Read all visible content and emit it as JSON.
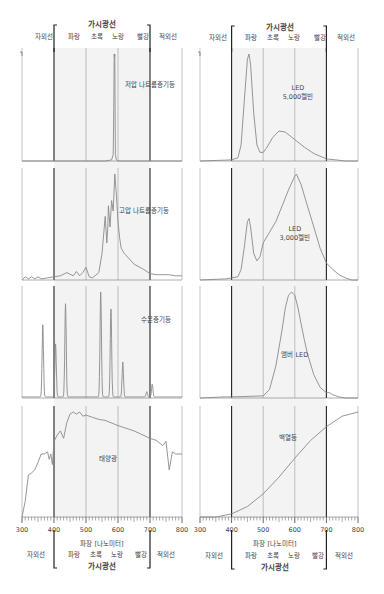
{
  "header": {
    "left": {
      "visible_label": "가시광선",
      "uv": "자외선",
      "ir": "적외선",
      "bands": [
        "파랑",
        "초록",
        "노랑",
        "빨강"
      ]
    },
    "right": {
      "visible_label": "가시광선",
      "uv": "자외선",
      "ir": "적외선",
      "bands": [
        "파랑",
        "초록",
        "노랑",
        "빨강"
      ]
    }
  },
  "footer": {
    "left": {
      "xlabel": "파장 [나노미터]",
      "visible_label": "가시광선",
      "uv": "자외선",
      "ir": "적외선",
      "bands": [
        "파랑",
        "초록",
        "노랑",
        "빨강"
      ]
    },
    "right": {
      "xlabel": "파장 [나노미터]",
      "visible_label": "가시광선",
      "uv": "자외선",
      "ir": "적외선",
      "bands": [
        "파랑",
        "초록",
        "노랑",
        "빨강"
      ]
    }
  },
  "colors": {
    "curve": "#8a8a8a",
    "boundary_line": "#222222",
    "grid_line": "#9a9a9a",
    "visible_fill": "#f3f3f3",
    "text": "#444444"
  },
  "chart_data": [
    {
      "type": "line",
      "title": "저압 나트륨증기등",
      "xlabel": "파장 [나노미터]",
      "ylabel": "",
      "xlim": [
        300,
        800
      ],
      "ylim": [
        0,
        1
      ],
      "x": [
        300,
        560,
        580,
        585,
        587,
        588,
        589,
        590,
        591,
        592,
        595,
        600,
        800
      ],
      "values": [
        0,
        0,
        0.01,
        0.06,
        0.5,
        1.0,
        0.97,
        1.0,
        0.5,
        0.06,
        0.01,
        0,
        0
      ]
    },
    {
      "type": "line",
      "title": "LED 5,000켈빈",
      "xlabel": "파장 [나노미터]",
      "ylabel": "",
      "xlim": [
        300,
        800
      ],
      "ylim": [
        0,
        1
      ],
      "x": [
        300,
        400,
        420,
        430,
        440,
        450,
        455,
        460,
        470,
        480,
        490,
        500,
        510,
        530,
        550,
        570,
        600,
        630,
        660,
        700,
        730,
        760,
        800
      ],
      "values": [
        0,
        0.01,
        0.03,
        0.15,
        0.55,
        0.95,
        1.0,
        0.9,
        0.45,
        0.15,
        0.08,
        0.08,
        0.12,
        0.22,
        0.28,
        0.27,
        0.2,
        0.13,
        0.07,
        0.02,
        0.01,
        0.0,
        0
      ]
    },
    {
      "type": "line",
      "title": "고압 나트륨증기등",
      "xlabel": "파장 [나노미터]",
      "ylabel": "",
      "xlim": [
        300,
        800
      ],
      "ylim": [
        0,
        1
      ],
      "x": [
        300,
        310,
        320,
        330,
        340,
        350,
        360,
        380,
        400,
        420,
        440,
        460,
        470,
        480,
        490,
        500,
        510,
        520,
        540,
        550,
        560,
        565,
        568,
        570,
        575,
        580,
        585,
        590,
        595,
        600,
        605,
        610,
        620,
        650,
        680,
        700,
        720,
        740,
        760,
        780,
        800
      ],
      "values": [
        0.0,
        0.03,
        0.01,
        0.03,
        0.01,
        0.03,
        0.01,
        0.02,
        0.03,
        0.04,
        0.07,
        0.04,
        0.08,
        0.04,
        0.07,
        0.12,
        0.03,
        0.02,
        0.07,
        0.25,
        0.6,
        0.35,
        0.5,
        0.7,
        0.5,
        0.75,
        0.65,
        1.0,
        0.8,
        0.55,
        0.4,
        0.3,
        0.25,
        0.15,
        0.1,
        0.06,
        0.05,
        0.05,
        0.05,
        0.04,
        0.04
      ]
    },
    {
      "type": "line",
      "title": "LED 3,000켈빈",
      "xlabel": "파장 [나노미터]",
      "ylabel": "",
      "xlim": [
        300,
        800
      ],
      "ylim": [
        0,
        1
      ],
      "x": [
        300,
        380,
        400,
        420,
        430,
        440,
        450,
        455,
        460,
        470,
        480,
        490,
        500,
        520,
        540,
        560,
        580,
        600,
        605,
        620,
        640,
        660,
        680,
        700,
        720,
        740,
        760,
        780,
        800
      ],
      "values": [
        0,
        0.01,
        0.02,
        0.03,
        0.1,
        0.3,
        0.55,
        0.58,
        0.5,
        0.25,
        0.18,
        0.22,
        0.35,
        0.45,
        0.55,
        0.7,
        0.85,
        0.98,
        1.0,
        0.9,
        0.7,
        0.5,
        0.3,
        0.16,
        0.1,
        0.05,
        0.02,
        0.0,
        0
      ]
    },
    {
      "type": "line",
      "title": "수은증기등",
      "xlabel": "파장 [나노미터]",
      "ylabel": "",
      "xlim": [
        300,
        800
      ],
      "ylim": [
        0,
        1
      ],
      "peaks_nm": [
        365,
        405,
        436,
        546,
        578,
        615,
        690,
        707
      ],
      "peak_values": [
        0.68,
        0.5,
        0.88,
        1.0,
        0.83,
        0.33,
        0.05,
        0.12
      ]
    },
    {
      "type": "line",
      "title": "앰버 LED",
      "xlabel": "파장 [나노미터]",
      "ylabel": "",
      "xlim": [
        300,
        800
      ],
      "ylim": [
        0,
        1
      ],
      "x": [
        300,
        380,
        400,
        500,
        520,
        540,
        560,
        570,
        580,
        590,
        600,
        610,
        620,
        630,
        640,
        660,
        680,
        700,
        710,
        720,
        740,
        760,
        800
      ],
      "values": [
        0,
        0.01,
        0.01,
        0.02,
        0.08,
        0.3,
        0.65,
        0.85,
        0.97,
        1.0,
        0.97,
        0.85,
        0.7,
        0.55,
        0.42,
        0.22,
        0.1,
        0.05,
        0.05,
        0.03,
        0.01,
        0.0,
        0
      ]
    },
    {
      "type": "line",
      "title": "태양광",
      "xlabel": "파장 [나노미터]",
      "ylabel": "",
      "xlim": [
        300,
        800
      ],
      "ylim": [
        0,
        1
      ],
      "x": [
        300,
        310,
        320,
        330,
        340,
        350,
        360,
        370,
        380,
        385,
        390,
        395,
        400,
        410,
        420,
        430,
        440,
        450,
        460,
        470,
        480,
        490,
        500,
        520,
        540,
        560,
        600,
        650,
        700,
        720,
        740,
        750,
        760,
        770,
        780,
        800
      ],
      "values": [
        0.0,
        0.15,
        0.4,
        0.42,
        0.45,
        0.52,
        0.6,
        0.6,
        0.62,
        0.55,
        0.6,
        0.5,
        0.72,
        0.78,
        0.82,
        0.75,
        0.9,
        0.98,
        1.0,
        0.98,
        1.0,
        0.96,
        0.97,
        0.95,
        0.93,
        0.92,
        0.87,
        0.82,
        0.75,
        0.73,
        0.68,
        0.72,
        0.45,
        0.62,
        0.6,
        0.6
      ]
    },
    {
      "type": "line",
      "title": "백열등",
      "xlabel": "파장 [나노미터]",
      "ylabel": "",
      "xlim": [
        300,
        800
      ],
      "ylim": [
        0,
        1
      ],
      "x": [
        300,
        350,
        400,
        450,
        500,
        550,
        600,
        650,
        700,
        750,
        800
      ],
      "values": [
        0,
        0.0,
        0.03,
        0.1,
        0.22,
        0.38,
        0.56,
        0.73,
        0.86,
        0.96,
        1.0
      ]
    }
  ],
  "axis": {
    "ticks": [
      "300",
      "400",
      "500",
      "600",
      "700",
      "800"
    ]
  }
}
